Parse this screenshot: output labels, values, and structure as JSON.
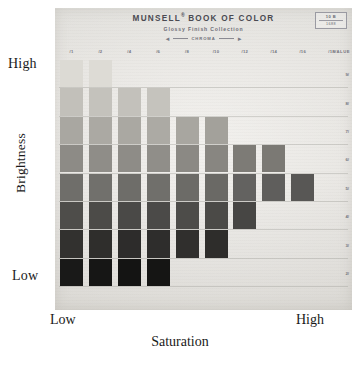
{
  "header": {
    "title": "MUNSELL",
    "title_sup": "®",
    "title_rest": "BOOK OF COLOR",
    "subtitle": "Glossy Finish Collection",
    "chroma_label": "CHROMA",
    "code_top": "10 B",
    "code_bottom": "1688"
  },
  "axes": {
    "left_top": "High",
    "left_bottom": "Low",
    "left_title": "Brightness",
    "bottom_left": "Low",
    "bottom_right": "High",
    "bottom_title": "Saturation"
  },
  "chart_data": {
    "type": "heatmap",
    "xlabel": "Saturation",
    "ylabel": "Brightness",
    "grid": true,
    "legend": "none",
    "x_axis_label_right": "CHROMA",
    "y_axis_label_right": "VALUE",
    "categories": [
      "/1",
      "/2",
      "/4",
      "/6",
      "/8",
      "/10",
      "/12",
      "/14",
      "/16",
      "/18"
    ],
    "value_ticks": [
      "9/",
      "8/",
      "7/",
      "6/",
      "5/",
      "4/",
      "3/",
      "2/"
    ],
    "x": [
      1,
      2,
      4,
      6,
      8,
      10,
      12,
      14,
      16,
      18
    ],
    "y": [
      9,
      8,
      7,
      6,
      5,
      4,
      3,
      2
    ],
    "note": "Each cell is a Munsell colour chip; blank cells are outside the pigment gamut.",
    "cells": [
      {
        "chroma": 1,
        "value": 9,
        "hex": "#dcdad4"
      },
      {
        "chroma": 1,
        "value": 8,
        "hex": "#c2c0ba"
      },
      {
        "chroma": 1,
        "value": 7,
        "hex": "#a9a7a1"
      },
      {
        "chroma": 1,
        "value": 6,
        "hex": "#8d8b86"
      },
      {
        "chroma": 1,
        "value": 5,
        "hex": "#6f6e6a"
      },
      {
        "chroma": 1,
        "value": 4,
        "hex": "#4e4d4a"
      },
      {
        "chroma": 1,
        "value": 3,
        "hex": "#32312f"
      },
      {
        "chroma": 1,
        "value": 2,
        "hex": "#191918"
      },
      {
        "chroma": 2,
        "value": 9,
        "hex": "#dddbd5"
      },
      {
        "chroma": 2,
        "value": 8,
        "hex": "#c4c2bc"
      },
      {
        "chroma": 2,
        "value": 7,
        "hex": "#aba9a3"
      },
      {
        "chroma": 2,
        "value": 6,
        "hex": "#8f8d88"
      },
      {
        "chroma": 2,
        "value": 5,
        "hex": "#71706c"
      },
      {
        "chroma": 2,
        "value": 4,
        "hex": "#4c4b48"
      },
      {
        "chroma": 2,
        "value": 3,
        "hex": "#2f2e2c"
      },
      {
        "chroma": 2,
        "value": 2,
        "hex": "#161615"
      },
      {
        "chroma": 4,
        "value": 8,
        "hex": "#c3c1bb"
      },
      {
        "chroma": 4,
        "value": 7,
        "hex": "#aaa8a2"
      },
      {
        "chroma": 4,
        "value": 6,
        "hex": "#8e8c87"
      },
      {
        "chroma": 4,
        "value": 5,
        "hex": "#6e6d69"
      },
      {
        "chroma": 4,
        "value": 4,
        "hex": "#4a4947"
      },
      {
        "chroma": 4,
        "value": 3,
        "hex": "#2d2c2b"
      },
      {
        "chroma": 4,
        "value": 2,
        "hex": "#141413"
      },
      {
        "chroma": 6,
        "value": 8,
        "hex": "#c5c3bd"
      },
      {
        "chroma": 6,
        "value": 7,
        "hex": "#acaaa4"
      },
      {
        "chroma": 6,
        "value": 6,
        "hex": "#908e89"
      },
      {
        "chroma": 6,
        "value": 5,
        "hex": "#706f6b"
      },
      {
        "chroma": 6,
        "value": 4,
        "hex": "#4b4a48"
      },
      {
        "chroma": 6,
        "value": 3,
        "hex": "#2e2d2c"
      },
      {
        "chroma": 6,
        "value": 2,
        "hex": "#151514"
      },
      {
        "chroma": 8,
        "value": 7,
        "hex": "#a8a6a0"
      },
      {
        "chroma": 8,
        "value": 6,
        "hex": "#8b8984"
      },
      {
        "chroma": 8,
        "value": 5,
        "hex": "#6c6b67"
      },
      {
        "chroma": 8,
        "value": 4,
        "hex": "#4d4c49"
      },
      {
        "chroma": 8,
        "value": 3,
        "hex": "#302f2d"
      },
      {
        "chroma": 10,
        "value": 7,
        "hex": "#a3a19b"
      },
      {
        "chroma": 10,
        "value": 6,
        "hex": "#888681"
      },
      {
        "chroma": 10,
        "value": 5,
        "hex": "#6a6965"
      },
      {
        "chroma": 10,
        "value": 4,
        "hex": "#4b4a47"
      },
      {
        "chroma": 10,
        "value": 3,
        "hex": "#2e2d2b"
      },
      {
        "chroma": 12,
        "value": 6,
        "hex": "#7d7b76"
      },
      {
        "chroma": 12,
        "value": 5,
        "hex": "#636260"
      },
      {
        "chroma": 12,
        "value": 4,
        "hex": "#474644"
      },
      {
        "chroma": 14,
        "value": 6,
        "hex": "#7b7974"
      },
      {
        "chroma": 14,
        "value": 5,
        "hex": "#5f5e5c"
      },
      {
        "chroma": 16,
        "value": 5,
        "hex": "#585755"
      }
    ]
  }
}
